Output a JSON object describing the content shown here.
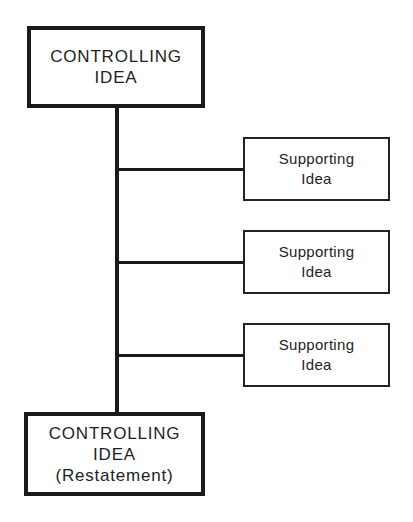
{
  "diagram": {
    "type": "hierarchy",
    "top_box": {
      "line1": "CONTROLLING",
      "line2": "IDEA"
    },
    "supporting_boxes": [
      {
        "line1": "Supporting",
        "line2": "Idea"
      },
      {
        "line1": "Supporting",
        "line2": "Idea"
      },
      {
        "line1": "Supporting",
        "line2": "Idea"
      }
    ],
    "bottom_box": {
      "line1": "CONTROLLING",
      "line2": "IDEA",
      "line3": "(Restatement)"
    },
    "colors": {
      "stroke": "#1a1a1a",
      "background": "#ffffff"
    }
  }
}
